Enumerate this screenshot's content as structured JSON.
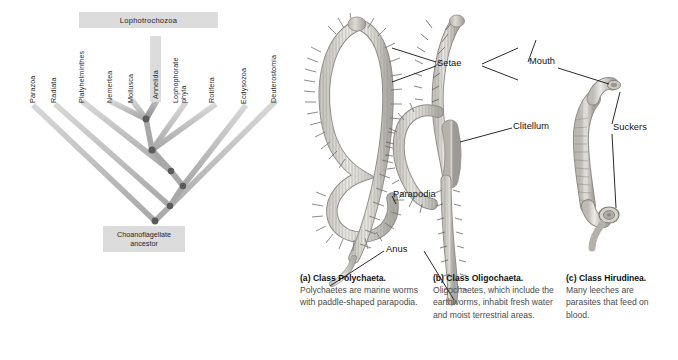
{
  "figure": {
    "clade_bar_label": "Lophotrochozoa",
    "ancestor_line1": "Choanoflagellate",
    "ancestor_line2": "ancestor",
    "colors": {
      "branch": "#a8a8a8",
      "branch_highlight": "#8f8f8f",
      "branch_faint": "#c9c9c9",
      "node": "#5a5a5a",
      "label_box": "#dcdcdc",
      "text": "#1f1f1f",
      "caption_body": "#4b4b4b",
      "background": "#ffffff"
    },
    "taxa": [
      {
        "label": "Parazoa",
        "highlighted": false
      },
      {
        "label": "Radiata",
        "highlighted": false
      },
      {
        "label": "Platyhelminthes",
        "highlighted": false
      },
      {
        "label": "Nemertea",
        "highlighted": false
      },
      {
        "label": "Mollusca",
        "highlighted": false
      },
      {
        "label": "Annelida",
        "highlighted": true
      },
      {
        "label": "Lophophorate\nphyla",
        "highlighted": false
      },
      {
        "label": "Rotifera",
        "highlighted": false
      },
      {
        "label": "Ecdysozoa",
        "highlighted": false
      },
      {
        "label": "Deuterostomia",
        "highlighted": false
      }
    ]
  },
  "annotations": [
    {
      "id": "setae",
      "label": "Setae"
    },
    {
      "id": "mouth",
      "label": "Mouth"
    },
    {
      "id": "clitellum",
      "label": "Clitellum"
    },
    {
      "id": "suckers",
      "label": "Suckers"
    },
    {
      "id": "parapodia",
      "label": "Parapodia"
    },
    {
      "id": "anus",
      "label": "Anus"
    }
  ],
  "captions": [
    {
      "head": "(a) Class Polychaeta.",
      "body": "Polychaetes are marine worms with paddle-shaped parapodia."
    },
    {
      "head": "(b) Class Oligochaeta.",
      "body": "Oligochaetes, which include the earthworms, inhabit fresh water and moist terrestrial areas."
    },
    {
      "head": "(c) Class Hirudinea.",
      "body": "Many leeches are parasites that feed on blood."
    }
  ]
}
